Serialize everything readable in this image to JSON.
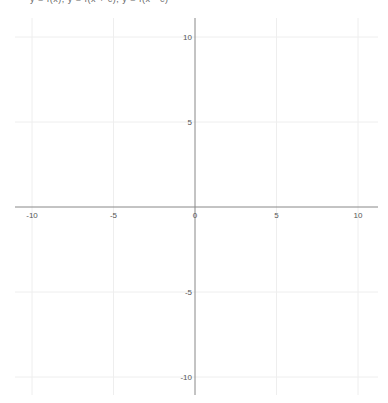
{
  "header": {
    "equations_text": "y = f(x), y = f(x + c), y = f(x - c)"
  },
  "chart_data": {
    "type": "line",
    "title": "",
    "xlabel": "",
    "ylabel": "",
    "xlim": [
      -11,
      11
    ],
    "ylim": [
      -11,
      11
    ],
    "grid": true,
    "grid_step": 5,
    "x_ticks": [
      -10,
      -5,
      0,
      5,
      10
    ],
    "y_ticks": [
      10,
      5,
      -5,
      -10
    ],
    "x_tick_labels": [
      "-10",
      "-5",
      "0",
      "5",
      "10"
    ],
    "y_tick_labels": [
      "10",
      "5",
      "-5",
      "-10"
    ],
    "series": [],
    "colors": {
      "axis": "#888888",
      "grid": "#eeeeee",
      "label": "#555555"
    }
  }
}
